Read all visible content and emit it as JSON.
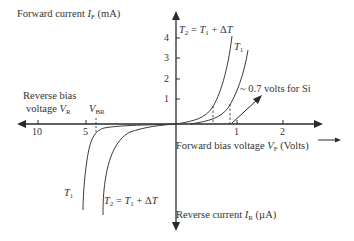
{
  "diagram": {
    "y_axis_top_label": {
      "prefix": "Forward current ",
      "var": "I",
      "sub": "F",
      "unit": " (mA)"
    },
    "y_axis_bottom_label": {
      "prefix": "Reverse current ",
      "var": "I",
      "sub": "R",
      "unit": " (µA)"
    },
    "x_axis_right_label": {
      "prefix": "Forward bias voltage ",
      "var": "V",
      "sub": "F",
      "unit": " (Volts)"
    },
    "x_axis_left_label": {
      "line1": "Reverse bias",
      "line2_prefix": "voltage ",
      "var": "V",
      "sub": "R"
    },
    "breakdown_label": {
      "var": "V",
      "sub": "BR"
    },
    "y_ticks": [
      "4",
      "3",
      "2",
      "1"
    ],
    "x_ticks_positive": [
      "1",
      "2"
    ],
    "x_ticks_negative": [
      "10",
      "5"
    ],
    "annotation": "~ 0.7 volts for Si",
    "curve_labels": {
      "forward_t2": {
        "text_a": "T",
        "sub_a": "2",
        "text_b": " = ",
        "text_c": "T",
        "sub_c": "1",
        "text_d": " + Δ",
        "text_e": "T"
      },
      "forward_t1": {
        "text": "T",
        "sub": "1"
      },
      "reverse_t1": {
        "text": "T",
        "sub": "1"
      },
      "reverse_t2": {
        "text_a": "T",
        "sub_a": "2",
        "text_b": " = ",
        "text_c": "T",
        "sub_c": "1",
        "text_d": " + Δ",
        "text_e": "T"
      }
    },
    "colors": {
      "axis": "#2a2a2a",
      "curve": "#3a3a3a",
      "text": "#333333",
      "background": "#ffffff"
    }
  }
}
